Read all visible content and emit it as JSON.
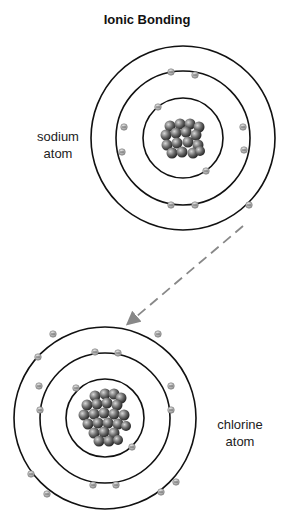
{
  "title": "Ionic Bonding",
  "atoms": [
    {
      "name": "sodium",
      "label_line1": "sodium",
      "label_line2": "atom",
      "center": [
        183,
        138
      ],
      "shell_radii": [
        40,
        67,
        92
      ],
      "electrons_per_shell": [
        2,
        8,
        1
      ]
    },
    {
      "name": "chlorine",
      "label_line1": "chlorine",
      "label_line2": "atom",
      "center": [
        105,
        418
      ],
      "shell_radii": [
        39,
        65,
        91
      ],
      "electrons_per_shell": [
        2,
        8,
        7
      ]
    }
  ],
  "arrow": {
    "style": "dashed",
    "color": "#888888",
    "from": [
      243,
      226
    ],
    "to": [
      128,
      324
    ],
    "meaning": "electron transfer from sodium to chlorine"
  },
  "colors": {
    "shell": "#111111",
    "electron": "#9a9a9a",
    "nucleus": "#555555"
  }
}
